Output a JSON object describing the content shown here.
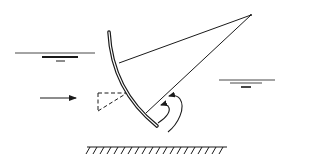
{
  "diagram": {
    "type": "radial-gate-schematic",
    "colors": {
      "background": "#ffffff",
      "ink": "#1a1a1a"
    },
    "elements": [
      {
        "id": "upstream-water-surface",
        "symbol": "water-level-icon"
      },
      {
        "id": "downstream-water-surface",
        "symbol": "water-level-icon"
      },
      {
        "id": "flow-direction-arrow",
        "symbol": "arrow-right-icon"
      },
      {
        "id": "radial-gate-skin",
        "symbol": "curved-gate"
      },
      {
        "id": "gate-arms",
        "symbol": "strut-lines"
      },
      {
        "id": "trunnion-pivot",
        "symbol": "pivot-point"
      },
      {
        "id": "dashed-force-triangle",
        "symbol": "dashed-triangle"
      },
      {
        "id": "vortex-flow-arrows",
        "symbol": "curved-arrow-icon"
      },
      {
        "id": "channel-bed",
        "symbol": "hatched-ground"
      }
    ]
  }
}
